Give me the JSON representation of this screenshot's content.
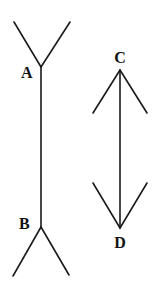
{
  "colors": {
    "line": "#1a1a1a",
    "label": "#111111",
    "background": "#ffffff"
  },
  "figures": [
    {
      "name": "outward-fins",
      "labels": {
        "top": "A",
        "bottom": "B"
      },
      "shaft": {
        "x": 41,
        "y1": 67,
        "y2": 227
      },
      "top_fins": [
        [
          14,
          22
        ],
        [
          70,
          22
        ]
      ],
      "bottom_fins": [
        [
          13,
          276
        ],
        [
          69,
          275
        ]
      ]
    },
    {
      "name": "inward-arrowheads",
      "labels": {
        "top": "C",
        "bottom": "D"
      },
      "shaft": {
        "x": 120,
        "y1": 70,
        "y2": 228
      },
      "top_fins": [
        [
          93,
          113
        ],
        [
          147,
          113
        ]
      ],
      "bottom_fins": [
        [
          93,
          183
        ],
        [
          147,
          183
        ]
      ]
    }
  ]
}
